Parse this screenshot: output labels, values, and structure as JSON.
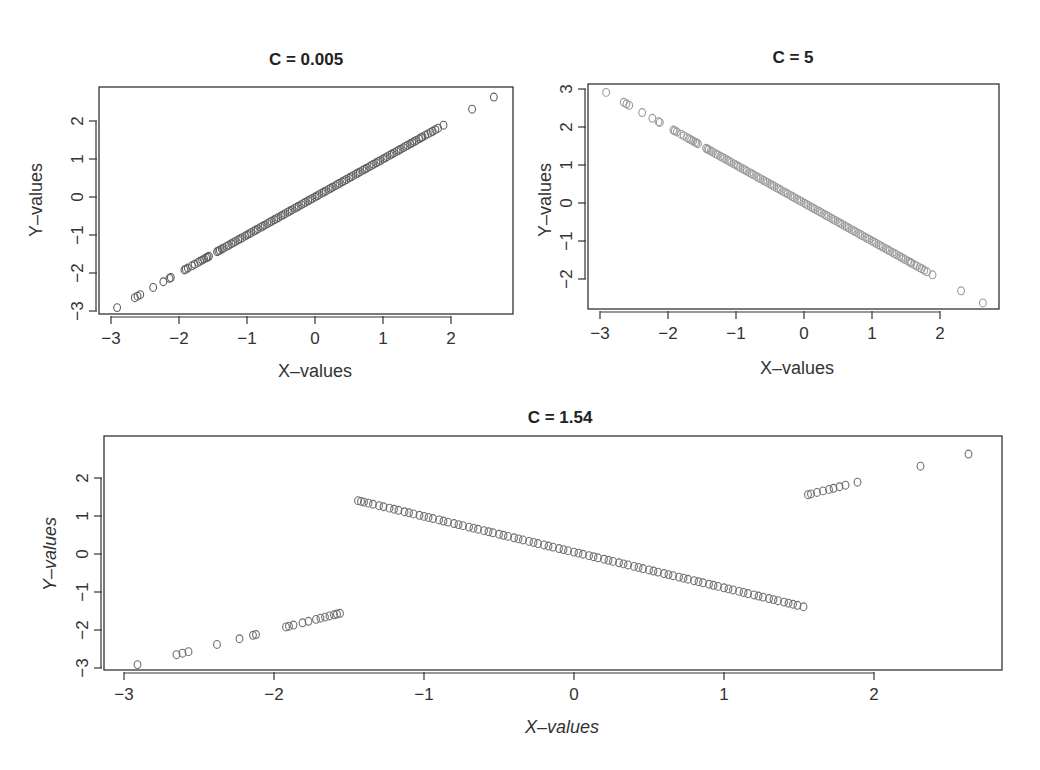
{
  "chart_data": [
    {
      "id": "plot1",
      "type": "scatter",
      "title": "C = 0.005",
      "xlabel": "X–values",
      "ylabel": "Y–values",
      "xlim": [
        -3.2,
        2.9
      ],
      "ylim": [
        -3.1,
        2.9
      ],
      "xticks": [
        -3,
        -2,
        -1,
        0,
        1,
        2
      ],
      "yticks": [
        -3,
        -2,
        -1,
        0,
        1,
        2
      ],
      "grid": false,
      "marker": "open-circle",
      "color": "#5f5f5f",
      "relation": "y = x",
      "x": [
        -2.91,
        -2.65,
        -2.61,
        -2.57,
        -2.38,
        -2.23,
        -2.14,
        -2.12,
        -1.92,
        -1.9,
        -1.87,
        -1.81,
        -1.77,
        -1.72,
        -1.69,
        -1.66,
        -1.63,
        -1.6,
        -1.58,
        -1.56,
        -1.44,
        -1.42,
        -1.4,
        -1.37,
        -1.34,
        -1.3,
        -1.27,
        -1.23,
        -1.2,
        -1.17,
        -1.13,
        -1.1,
        -1.07,
        -1.03,
        -1.0,
        -0.97,
        -0.94,
        -0.9,
        -0.87,
        -0.84,
        -0.8,
        -0.77,
        -0.74,
        -0.7,
        -0.67,
        -0.64,
        -0.6,
        -0.57,
        -0.54,
        -0.5,
        -0.47,
        -0.44,
        -0.4,
        -0.37,
        -0.34,
        -0.3,
        -0.27,
        -0.24,
        -0.2,
        -0.17,
        -0.14,
        -0.1,
        -0.07,
        -0.04,
        0.0,
        0.03,
        0.06,
        0.1,
        0.13,
        0.16,
        0.2,
        0.23,
        0.26,
        0.3,
        0.33,
        0.36,
        0.4,
        0.43,
        0.46,
        0.5,
        0.53,
        0.56,
        0.6,
        0.63,
        0.66,
        0.7,
        0.73,
        0.76,
        0.8,
        0.83,
        0.86,
        0.9,
        0.93,
        0.96,
        1.0,
        1.03,
        1.06,
        1.1,
        1.13,
        1.16,
        1.2,
        1.23,
        1.26,
        1.3,
        1.33,
        1.36,
        1.4,
        1.43,
        1.46,
        1.49,
        1.53,
        1.56,
        1.58,
        1.62,
        1.66,
        1.7,
        1.73,
        1.77,
        1.81,
        1.89,
        2.31,
        2.63
      ],
      "y": "same as x"
    },
    {
      "id": "plot2",
      "type": "scatter",
      "title": "C = 5",
      "xlabel": "X–values",
      "ylabel": "Y–values",
      "xlim": [
        -3.2,
        2.9
      ],
      "ylim": [
        -2.8,
        3.1
      ],
      "xticks": [
        -3,
        -2,
        -1,
        0,
        1,
        2
      ],
      "yticks": [
        -2,
        -1,
        0,
        1,
        2,
        3
      ],
      "grid": false,
      "marker": "open-circle",
      "color": "#9a9a9a",
      "relation": "y = -x",
      "x": "same as plot1",
      "y": "negated x"
    },
    {
      "id": "plot3",
      "type": "scatter",
      "title": "C = 1.54",
      "xlabel": "X–values",
      "ylabel": "Y–values",
      "xlim": [
        -3.13,
        2.85
      ],
      "ylim": [
        -3.1,
        3.0
      ],
      "xticks": [
        -3,
        -2,
        -1,
        0,
        1,
        2
      ],
      "yticks": [
        -3,
        -2,
        -1,
        0,
        1,
        2
      ],
      "grid": false,
      "marker": "open-circle",
      "color": "#6f6f6f",
      "relation": "y = x if |x| > 1.54 else -x",
      "threshold": 1.54,
      "x": "same as plot1",
      "y": "piecewise"
    }
  ],
  "labels": {
    "plot1_title": "C = 0.005",
    "plot2_title": "C = 5",
    "plot3_title": "C = 1.54",
    "xlabel": "X–values",
    "ylabel": "Y–values"
  }
}
